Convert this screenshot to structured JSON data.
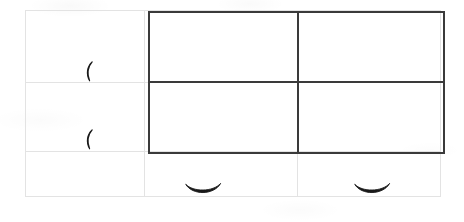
{
  "page": {
    "title": "Scanned grid worksheet",
    "background_color": "#ffffff",
    "width": 464,
    "height": 222
  },
  "light_grid": {
    "name": "faint table grid",
    "color": "#e3e3e3",
    "stroke_width": 1,
    "bounds": {
      "left": 25,
      "top": 10,
      "right": 440,
      "bottom": 196
    },
    "column_x": [
      25,
      144,
      297,
      440
    ],
    "row_y": [
      10,
      82,
      151,
      196
    ],
    "columns": 3,
    "rows": 3
  },
  "dark_grid": {
    "name": "bold table border",
    "color": "#3a3a3a",
    "stroke_width": 2,
    "bounds": {
      "left": 148,
      "top": 11,
      "right": 443,
      "bottom": 152
    },
    "column_x": [
      148,
      297,
      443
    ],
    "row_y": [
      11,
      81,
      152
    ],
    "columns": 2,
    "rows": 2
  },
  "marks": [
    {
      "id": "paren-1",
      "glyph": "(",
      "label": "left parenthesis mark",
      "cell": "column-1-row-1",
      "x": 84,
      "y": 61,
      "width": 10,
      "height": 20,
      "color": "#1a1a1a"
    },
    {
      "id": "paren-2",
      "glyph": "(",
      "label": "left parenthesis mark",
      "cell": "column-1-row-2",
      "x": 84,
      "y": 129,
      "width": 10,
      "height": 20,
      "color": "#1a1a1a"
    },
    {
      "id": "smile-1",
      "glyph": "⌣",
      "label": "smile arc mark",
      "cell": "column-2-row-3",
      "x": 185,
      "y": 182,
      "width": 36,
      "height": 14,
      "color": "#1a1a1a"
    },
    {
      "id": "smile-2",
      "glyph": "⌣",
      "label": "smile arc mark",
      "cell": "column-3-row-3",
      "x": 354,
      "y": 182,
      "width": 36,
      "height": 14,
      "color": "#1a1a1a"
    }
  ]
}
